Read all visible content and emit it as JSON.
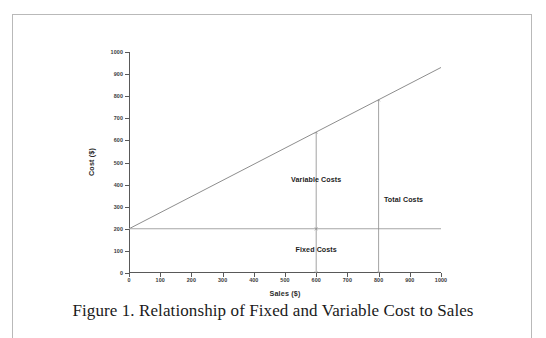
{
  "figure": {
    "caption": "Figure 1. Relationship of Fixed and Variable Cost to Sales"
  },
  "chart_data": {
    "type": "line",
    "title": "",
    "xlabel": "Sales ($)",
    "ylabel": "Cost ($)",
    "xlim": [
      0,
      1000
    ],
    "ylim": [
      0,
      1000
    ],
    "xticks": [
      0,
      100,
      200,
      300,
      400,
      500,
      600,
      700,
      800,
      900,
      1000
    ],
    "yticks": [
      0,
      100,
      200,
      300,
      400,
      500,
      600,
      700,
      800,
      900,
      1000
    ],
    "grid": false,
    "legend": "none",
    "series": [
      {
        "name": "Total Costs",
        "x": [
          0,
          1000
        ],
        "values": [
          200,
          930
        ],
        "color": "#808080",
        "intercept": 200,
        "slope": 0.73
      },
      {
        "name": "Fixed Costs",
        "x": [
          0,
          1000
        ],
        "values": [
          200,
          200
        ],
        "color": "#a6a6a6",
        "intercept": 200,
        "slope": 0
      }
    ],
    "annotations": [
      {
        "label": "Variable Costs",
        "x": 600,
        "y_from": 638,
        "y_to": 200,
        "label_x": 600,
        "label_y": 420,
        "arrow": "double"
      },
      {
        "label": "Fixed Costs",
        "x": 600,
        "y_from": 200,
        "y_to": 0,
        "label_x": 600,
        "label_y": 105,
        "arrow": "double"
      },
      {
        "label": "Total Costs",
        "x": 800,
        "y_from": 784,
        "y_to": 0,
        "label_x": 880,
        "label_y": 330,
        "arrow": "double"
      }
    ]
  }
}
